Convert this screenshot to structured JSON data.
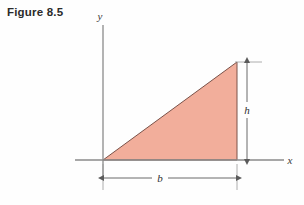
{
  "figure": {
    "caption": "Figure 8.5",
    "background_color": "#fefefe"
  },
  "axes": {
    "y_label": "y",
    "x_label": "x",
    "axis_color": "#808080",
    "origin": {
      "x": 103,
      "y": 160
    },
    "x_axis_start_x": 75,
    "x_axis_end_x": 284,
    "y_axis_top_y": 25
  },
  "shape": {
    "name": "right-triangle",
    "fill_color": "#f2ae9b",
    "stroke_color": "#6b4a42",
    "vertices": [
      {
        "x": 103,
        "y": 160
      },
      {
        "x": 237,
        "y": 160
      },
      {
        "x": 237,
        "y": 62
      }
    ]
  },
  "dimensions": {
    "height": {
      "label": "h",
      "line_x": 247,
      "top_y": 62,
      "bottom_y": 160,
      "color": "#5a5a5a"
    },
    "base": {
      "label": "b",
      "line_y": 178,
      "left_x": 103,
      "right_x": 237,
      "color": "#5a5a5a"
    }
  }
}
